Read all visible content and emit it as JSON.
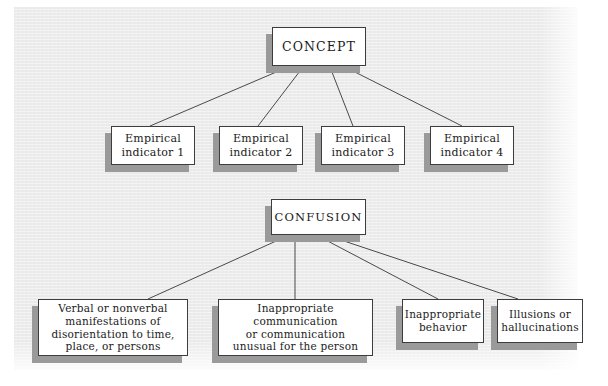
{
  "figure": {
    "name": "concept-operationalization-diagram",
    "background_color": "#ebebeb",
    "box_fill": "#ffffff",
    "box_border": "#3d3d3d",
    "shadow_color": "#9a9a9a",
    "line_color": "#4a4a4a"
  },
  "diagram": {
    "top": {
      "root": {
        "label": "CONCEPT"
      },
      "children": [
        {
          "label": "Empirical\nindicator 1"
        },
        {
          "label": "Empirical\nindicator 2"
        },
        {
          "label": "Empirical\nindicator 3"
        },
        {
          "label": "Empirical\nindicator 4"
        }
      ]
    },
    "bottom": {
      "root": {
        "label": "CONFUSION"
      },
      "children": [
        {
          "label": "Verbal or nonverbal\nmanifestations of\ndisorientation to time,\nplace, or persons"
        },
        {
          "label": "Inappropriate communication\nor communication\nunusual for the person"
        },
        {
          "label": "Inappropriate\nbehavior"
        },
        {
          "label": "Illusions or\nhallucinations"
        }
      ]
    }
  }
}
